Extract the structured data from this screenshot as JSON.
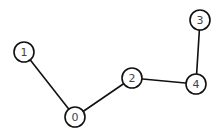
{
  "graph": {
    "nodes": [
      {
        "id": "0",
        "label": "0",
        "x": 75,
        "y": 117
      },
      {
        "id": "1",
        "label": "1",
        "x": 24,
        "y": 52
      },
      {
        "id": "2",
        "label": "2",
        "x": 132,
        "y": 78
      },
      {
        "id": "3",
        "label": "3",
        "x": 200,
        "y": 20
      },
      {
        "id": "4",
        "label": "4",
        "x": 196,
        "y": 84
      }
    ],
    "edges": [
      {
        "from": "1",
        "to": "0"
      },
      {
        "from": "0",
        "to": "2"
      },
      {
        "from": "2",
        "to": "4"
      },
      {
        "from": "4",
        "to": "3"
      }
    ],
    "node_radius": 10,
    "stroke_color": "#111111",
    "fill_color": "#ffffff"
  }
}
